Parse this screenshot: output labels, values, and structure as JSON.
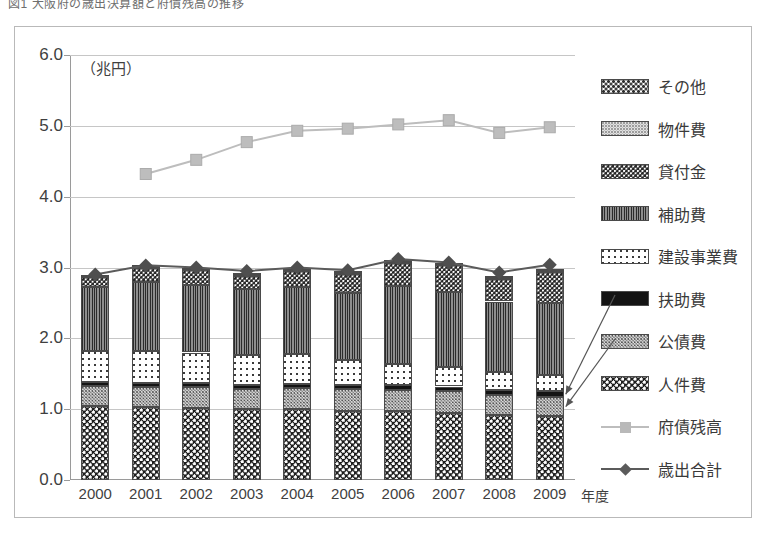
{
  "caption": {
    "text": "図1  大阪府の歳出決算額と府債残高の推移"
  },
  "chart_data": {
    "type": "bar",
    "subtype": "stacked-bar-with-lines",
    "title": "",
    "unit_label": "（兆円）",
    "xlabel": "年度",
    "ylabel": "",
    "ylim": [
      0.0,
      6.0
    ],
    "ytick_step": 1.0,
    "ytick_labels": [
      "6.0",
      "5.0",
      "4.0",
      "3.0",
      "2.0",
      "1.0",
      "0.0"
    ],
    "grid": true,
    "legend_position": "right",
    "categories": [
      "2000",
      "2001",
      "2002",
      "2003",
      "2004",
      "2005",
      "2006",
      "2007",
      "2008",
      "2009"
    ],
    "series": [
      {
        "name": "人件費",
        "type": "bar",
        "pattern": "jinken",
        "values": [
          1.05,
          1.03,
          1.02,
          1.0,
          1.0,
          0.98,
          0.97,
          0.95,
          0.92,
          0.9
        ]
      },
      {
        "name": "公債費",
        "type": "bar",
        "pattern": "kosai",
        "values": [
          0.28,
          0.28,
          0.29,
          0.28,
          0.3,
          0.3,
          0.3,
          0.3,
          0.28,
          0.27
        ]
      },
      {
        "name": "扶助費",
        "type": "bar",
        "pattern": "fujo",
        "values": [
          0.06,
          0.06,
          0.06,
          0.06,
          0.06,
          0.06,
          0.07,
          0.07,
          0.07,
          0.08
        ]
      },
      {
        "name": "建設事業費",
        "type": "bar",
        "pattern": "kensetsu",
        "values": [
          0.43,
          0.45,
          0.43,
          0.42,
          0.42,
          0.35,
          0.3,
          0.28,
          0.25,
          0.23
        ]
      },
      {
        "name": "補助費",
        "type": "bar",
        "pattern": "hojo",
        "values": [
          0.9,
          0.97,
          0.95,
          0.93,
          0.95,
          0.95,
          1.1,
          1.05,
          1.0,
          1.02
        ]
      },
      {
        "name": "貸付金",
        "type": "bar",
        "pattern": "kashitsuke",
        "values": [
          0.14,
          0.2,
          0.21,
          0.19,
          0.22,
          0.27,
          0.33,
          0.38,
          0.32,
          0.44
        ]
      },
      {
        "name": "物件費",
        "type": "bar",
        "pattern": "bukken",
        "values": [
          0.02,
          0.02,
          0.02,
          0.02,
          0.02,
          0.02,
          0.02,
          0.02,
          0.02,
          0.02
        ]
      },
      {
        "name": "その他",
        "type": "bar",
        "pattern": "sonota",
        "values": [
          0.02,
          0.02,
          0.02,
          0.02,
          0.02,
          0.02,
          0.02,
          0.02,
          0.02,
          0.02
        ]
      },
      {
        "name": "府債残高",
        "type": "line",
        "color": "#bdbdbd",
        "marker": "square",
        "values": [
          null,
          4.32,
          4.52,
          4.77,
          4.93,
          4.96,
          5.02,
          5.08,
          4.9,
          4.98
        ]
      },
      {
        "name": "歳出合計",
        "type": "line",
        "color": "#5b5b5b",
        "marker": "diamond",
        "values": [
          2.9,
          3.03,
          3.0,
          2.95,
          3.0,
          2.96,
          3.12,
          3.07,
          2.93,
          3.04
        ]
      }
    ],
    "annotations": [
      {
        "note": "arrow from 扶助費 legend to 2009 bar segment"
      },
      {
        "note": "arrow from 公債費 legend to 2009 bar segment"
      }
    ]
  },
  "legend": {
    "items": [
      {
        "label": "その他",
        "key": "sonota",
        "kind": "patch"
      },
      {
        "label": "物件費",
        "key": "bukken",
        "kind": "patch"
      },
      {
        "label": "貸付金",
        "key": "kashitsuke",
        "kind": "patch"
      },
      {
        "label": "補助費",
        "key": "hojo",
        "kind": "patch"
      },
      {
        "label": "建設事業費",
        "key": "kensetsu",
        "kind": "patch"
      },
      {
        "label": "扶助費",
        "key": "fujo",
        "kind": "patch"
      },
      {
        "label": "公債費",
        "key": "kosai",
        "kind": "patch"
      },
      {
        "label": "人件費",
        "key": "jinken",
        "kind": "patch"
      },
      {
        "label": "府債残高",
        "key": "fusai",
        "kind": "line-square"
      },
      {
        "label": "歳出合計",
        "key": "saishutsu",
        "kind": "line-diamond"
      }
    ]
  }
}
